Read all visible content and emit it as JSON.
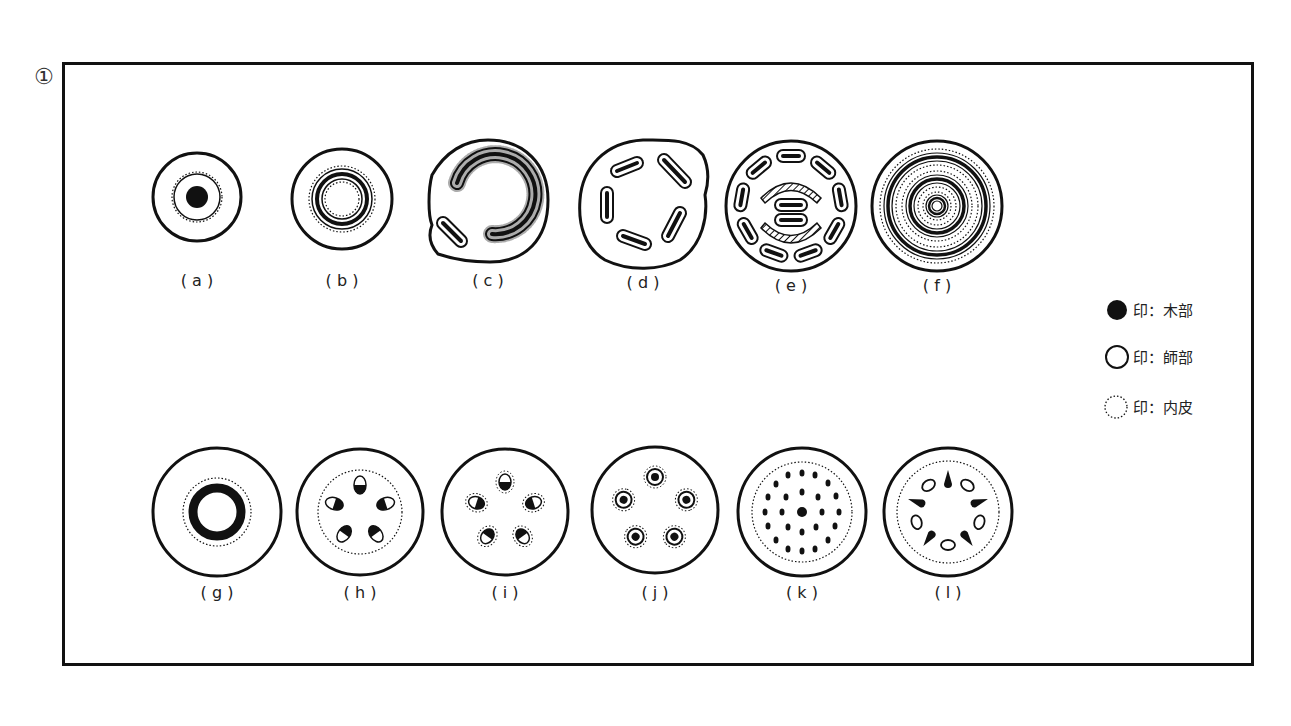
{
  "figure": {
    "number": "①"
  },
  "panels": [
    {
      "id": "a",
      "label": "( a )",
      "cx": 197,
      "cy": 197,
      "r": 44,
      "type": "protostele"
    },
    {
      "id": "b",
      "label": "( b )",
      "cx": 342,
      "cy": 199,
      "r": 50,
      "type": "siphonostele"
    },
    {
      "id": "c",
      "label": "( c )",
      "cx": 488,
      "cy": 200,
      "r": 60,
      "type": "solenostele-gap"
    },
    {
      "id": "d",
      "label": "( d )",
      "cx": 643,
      "cy": 203,
      "r": 63,
      "type": "dictyostele"
    },
    {
      "id": "e",
      "label": "( e )",
      "cx": 791,
      "cy": 206,
      "r": 65,
      "type": "polycyclic-dictyostele"
    },
    {
      "id": "f",
      "label": "( f )",
      "cx": 937,
      "cy": 206,
      "r": 65,
      "type": "polycyclic-siphonostele"
    },
    {
      "id": "g",
      "label": "( g )",
      "cx": 217,
      "cy": 512,
      "r": 64,
      "type": "eustele-ring"
    },
    {
      "id": "h",
      "label": "( h )",
      "cx": 360,
      "cy": 512,
      "r": 63,
      "type": "eustele-collateral"
    },
    {
      "id": "i",
      "label": "( i )",
      "cx": 505,
      "cy": 512,
      "r": 63,
      "type": "eustele-bicollateral"
    },
    {
      "id": "j",
      "label": "( j )",
      "cx": 655,
      "cy": 510,
      "r": 63,
      "type": "concentric-bundles"
    },
    {
      "id": "k",
      "label": "( k )",
      "cx": 802,
      "cy": 512,
      "r": 64,
      "type": "atactostele"
    },
    {
      "id": "l",
      "label": "( l )",
      "cx": 948,
      "cy": 512,
      "r": 64,
      "type": "radial-actinostele"
    }
  ],
  "legend": {
    "items": [
      {
        "symbol": "filled-circle",
        "text": "印：木部"
      },
      {
        "symbol": "open-circle",
        "text": "印：師部"
      },
      {
        "symbol": "dotted-circle",
        "text": "印：内皮"
      }
    ]
  },
  "colors": {
    "ink": "#111111",
    "background": "#ffffff"
  }
}
